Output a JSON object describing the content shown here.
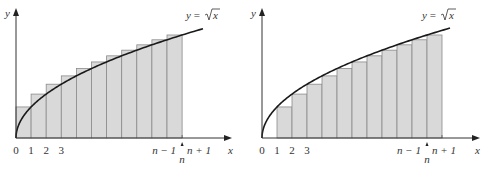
{
  "chart_data": [
    {
      "type": "bar",
      "subtype": "riemann-sum-left-overestimate",
      "title": "",
      "curve_label": "y = √x",
      "xlabel": "x",
      "ylabel": "y",
      "tick_labels": [
        "0",
        "1",
        "2",
        "3",
        "n − 1",
        "n",
        "n + 1"
      ],
      "bar_rule": "rectangle on [i−1, i] with height √i (upper sum)",
      "categories": [
        "[0,1]",
        "[1,2]",
        "[2,3]",
        "[3,4]",
        "[4,5]",
        "[5,6]",
        "[6,7]",
        "[7,8]",
        "[8,9]",
        "[9,10]",
        "[10,11]"
      ],
      "values": [
        1,
        1.414,
        1.732,
        2,
        2.236,
        2.449,
        2.646,
        2.828,
        3,
        3.162,
        3.317
      ],
      "curve": "y = sqrt(x)",
      "xlim": [
        0,
        13
      ],
      "grid": false,
      "legend": "none",
      "geometry": {
        "origin_x": 16,
        "origin_y": 138,
        "bar_w": 15.1,
        "n_bars": 11,
        "bar_start_index": 0,
        "x_end": 232,
        "y_top": 8,
        "curve_end_x": 203,
        "label_x": 186,
        "label_y": 19,
        "xlabel_x": 231
      }
    },
    {
      "type": "bar",
      "subtype": "riemann-sum-right-underestimate",
      "title": "",
      "curve_label": "y = √x",
      "xlabel": "x",
      "ylabel": "y",
      "tick_labels": [
        "0",
        "1",
        "2",
        "3",
        "n − 1",
        "n",
        "n + 1"
      ],
      "bar_rule": "rectangle on [i, i+1] with height √i (lower sum)",
      "categories": [
        "[1,2]",
        "[2,3]",
        "[3,4]",
        "[4,5]",
        "[5,6]",
        "[6,7]",
        "[7,8]",
        "[8,9]",
        "[9,10]",
        "[10,11]",
        "[11,12]"
      ],
      "values": [
        1,
        1.414,
        1.732,
        2,
        2.236,
        2.449,
        2.646,
        2.828,
        3,
        3.162,
        3.317
      ],
      "curve": "y = sqrt(x)",
      "xlim": [
        0,
        13
      ],
      "grid": false,
      "legend": "none",
      "geometry": {
        "origin_x": 262,
        "origin_y": 138,
        "bar_w": 15.0,
        "n_bars": 11,
        "bar_start_index": 1,
        "x_end": 480,
        "y_top": 8,
        "curve_end_x": 450,
        "label_x": 422,
        "label_y": 19,
        "xlabel_x": 478
      }
    }
  ],
  "labels": {
    "y_axis": "y",
    "x_axis": "x",
    "curve_y": "y",
    "curve_eq": "= ",
    "curve_x": "x",
    "t0": "0",
    "t1": "1",
    "t2": "2",
    "t3": "3",
    "t_nm1": "n − 1",
    "t_n": "n",
    "t_np1": "n + 1"
  }
}
